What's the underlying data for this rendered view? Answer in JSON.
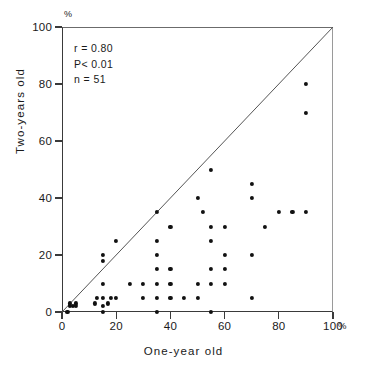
{
  "axes": {
    "x_title": "One-year old",
    "y_title": "Two-years old",
    "x_unit": "%",
    "y_unit": "%",
    "x_ticks": [
      "0",
      "20",
      "40",
      "60",
      "80",
      "100"
    ],
    "y_ticks": [
      "0",
      "20",
      "40",
      "60",
      "80",
      "100"
    ]
  },
  "annotations": {
    "r": "r = 0.80",
    "p": "P< 0.01",
    "n": "n = 51"
  },
  "chart_data": {
    "type": "scatter",
    "title": "",
    "xlabel": "One-year old",
    "ylabel": "Two-years old",
    "xlim": [
      0,
      100
    ],
    "ylim": [
      0,
      100
    ],
    "x_ticks": [
      0,
      20,
      40,
      60,
      80,
      100
    ],
    "y_ticks": [
      0,
      20,
      40,
      60,
      80,
      100
    ],
    "x_unit": "%",
    "y_unit": "%",
    "grid": false,
    "legend": "none",
    "marker": "filled-circle",
    "marker_color": "#111111",
    "reference_line": {
      "label": "identity line y = x",
      "from": [
        0,
        0
      ],
      "to": [
        100,
        100
      ],
      "color": "#555555"
    },
    "annotations": {
      "correlation_r": 0.8,
      "p_value_text": "P< 0.01",
      "n": 51
    },
    "points": [
      [
        2,
        0
      ],
      [
        3,
        2
      ],
      [
        3,
        3
      ],
      [
        4,
        2
      ],
      [
        5,
        3
      ],
      [
        5,
        2
      ],
      [
        12,
        3
      ],
      [
        13,
        5
      ],
      [
        15,
        0
      ],
      [
        15,
        2
      ],
      [
        15,
        5
      ],
      [
        15,
        10
      ],
      [
        15,
        18
      ],
      [
        15,
        20
      ],
      [
        17,
        3
      ],
      [
        18,
        5
      ],
      [
        20,
        5
      ],
      [
        20,
        25
      ],
      [
        25,
        10
      ],
      [
        30,
        5
      ],
      [
        30,
        10
      ],
      [
        35,
        0
      ],
      [
        35,
        5
      ],
      [
        35,
        10
      ],
      [
        35,
        15
      ],
      [
        35,
        20
      ],
      [
        35,
        25
      ],
      [
        35,
        35
      ],
      [
        40,
        5
      ],
      [
        40,
        10
      ],
      [
        40,
        15
      ],
      [
        40,
        30
      ],
      [
        45,
        5
      ],
      [
        50,
        5
      ],
      [
        50,
        10
      ],
      [
        50,
        40
      ],
      [
        52,
        35
      ],
      [
        55,
        0
      ],
      [
        55,
        10
      ],
      [
        55,
        15
      ],
      [
        55,
        25
      ],
      [
        55,
        30
      ],
      [
        55,
        50
      ],
      [
        60,
        10
      ],
      [
        60,
        15
      ],
      [
        60,
        20
      ],
      [
        60,
        30
      ],
      [
        70,
        5
      ],
      [
        70,
        20
      ],
      [
        70,
        40
      ],
      [
        70,
        45
      ],
      [
        75,
        30
      ],
      [
        80,
        35
      ],
      [
        85,
        35
      ],
      [
        90,
        35
      ],
      [
        90,
        70
      ],
      [
        90,
        80
      ]
    ]
  }
}
